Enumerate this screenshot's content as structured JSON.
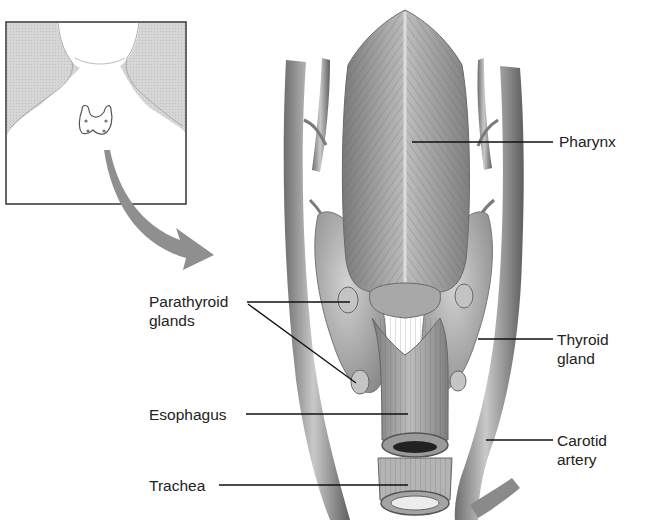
{
  "diagram": {
    "title": "",
    "inset": {
      "description": "Neck and shoulders outline with thyroid gland location",
      "icon": "neck-inset-icon",
      "arrow_icon": "curved-arrow-icon"
    },
    "labels": [
      {
        "id": "pharynx",
        "lines": [
          "Pharynx"
        ]
      },
      {
        "id": "parathyroid",
        "lines": [
          "Parathyroid",
          "glands"
        ]
      },
      {
        "id": "thyroid",
        "lines": [
          "Thyroid",
          "gland"
        ]
      },
      {
        "id": "esophagus",
        "lines": [
          "Esophagus"
        ]
      },
      {
        "id": "carotid",
        "lines": [
          "Carotid",
          "artery"
        ]
      },
      {
        "id": "trachea",
        "lines": [
          "Trachea"
        ]
      }
    ],
    "colors": {
      "line": "#111111",
      "tissue": "#9a9a9a",
      "tissue_light": "#c8c8c8",
      "inset_shade": "#d4d4d4",
      "arrow": "#8f8f8f"
    }
  }
}
